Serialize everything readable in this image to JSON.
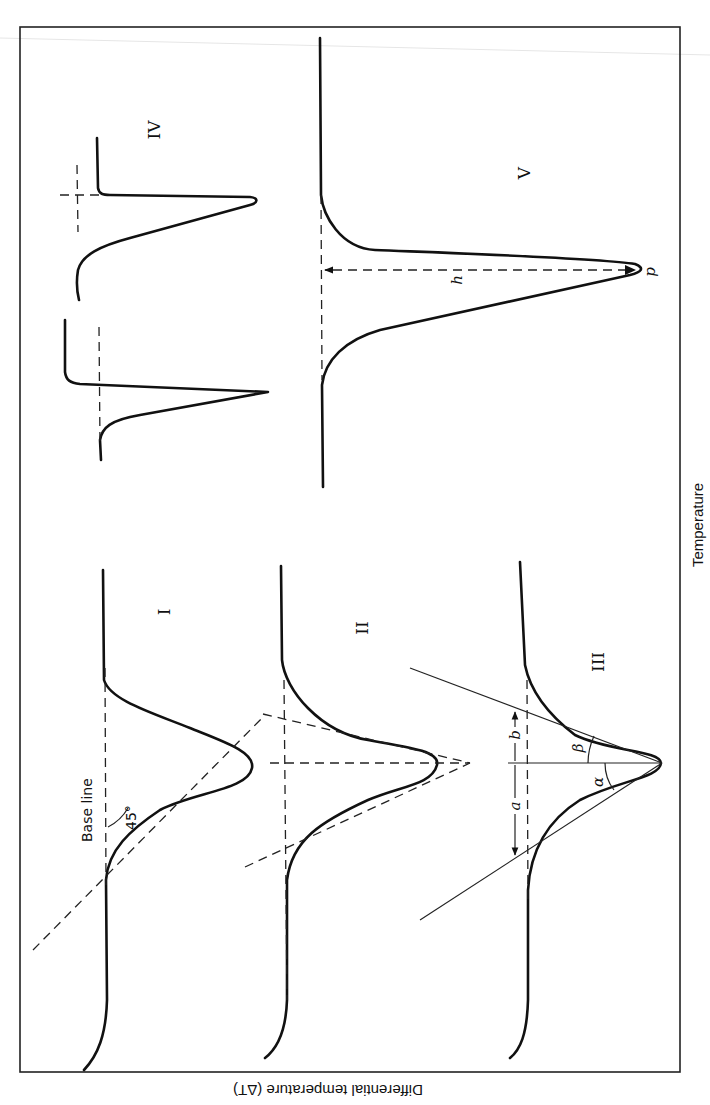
{
  "figure": {
    "x_axis_label": "Temperature",
    "y_axis_label": "Differential temperature (ΔT)",
    "orientation": "rotated 90° clockwise (page scanned sideways)",
    "curves": [
      {
        "id": "I",
        "label": "I",
        "annotations": {
          "baseline_label": "Base line",
          "angle_label": "45°"
        }
      },
      {
        "id": "II",
        "label": "II"
      },
      {
        "id": "III",
        "label": "III",
        "annotations": {
          "distance_a": "a",
          "distance_b": "b",
          "angle_alpha": "α",
          "angle_beta": "β"
        }
      },
      {
        "id": "IV",
        "label": "IV"
      },
      {
        "id": "V",
        "label": "V",
        "annotations": {
          "height": "h",
          "peak_point": "p"
        }
      }
    ]
  },
  "colors": {
    "ink": "#111111",
    "paper": "#ffffff"
  }
}
